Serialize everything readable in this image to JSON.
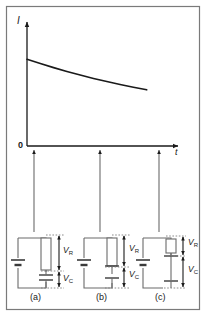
{
  "figure": {
    "border_color": "#7a7a7a",
    "line_color": "#1a1a1a",
    "dash_color": "#808080",
    "circuit_color": "#6b6b6b"
  },
  "chart_data": {
    "type": "line",
    "title": "",
    "xlabel": "t",
    "ylabel": "I",
    "origin_label": "0",
    "grid": false,
    "legend": false,
    "xlim": [
      0,
      1
    ],
    "ylim": [
      0,
      1
    ],
    "x": [
      0.0,
      0.1,
      0.2,
      0.3,
      0.4,
      0.5,
      0.6,
      0.7,
      0.8,
      0.9
    ],
    "y": [
      0.7,
      0.665,
      0.632,
      0.601,
      0.572,
      0.545,
      0.52,
      0.496,
      0.474,
      0.453
    ],
    "annotations": [
      {
        "label": "(a)",
        "x": 0.045
      },
      {
        "label": "(b)",
        "x": 0.485
      },
      {
        "label": "(c)",
        "x": 0.88
      }
    ]
  },
  "axes": {
    "y_axis_label": "I",
    "x_axis_label": "t",
    "origin": "0"
  },
  "circuits": [
    {
      "id": "a",
      "caption": "(a)",
      "resistor_voltage_label": "V",
      "resistor_voltage_sub": "R",
      "capacitor_voltage_label": "V",
      "capacitor_voltage_sub": "C",
      "state": "V_R large, V_C small"
    },
    {
      "id": "b",
      "caption": "(b)",
      "resistor_voltage_label": "V",
      "resistor_voltage_sub": "R",
      "capacitor_voltage_label": "V",
      "capacitor_voltage_sub": "C",
      "state": "V_R medium, V_C medium"
    },
    {
      "id": "c",
      "caption": "(c)",
      "resistor_voltage_label": "V",
      "resistor_voltage_sub": "R",
      "capacitor_voltage_label": "V",
      "capacitor_voltage_sub": "C",
      "state": "V_R small, V_C large"
    }
  ]
}
